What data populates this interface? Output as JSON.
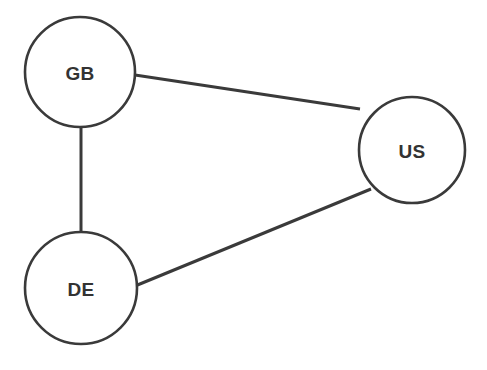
{
  "diagram": {
    "type": "node-link-graph",
    "title": "",
    "background_color": "#ffffff",
    "node_fill": "#ffffff",
    "node_stroke": "#3a3a3a",
    "edge_color": "#3a3a3a",
    "label_color": "#333333",
    "nodes": [
      {
        "id": "GB",
        "label": "GB",
        "cx": 80,
        "cy": 72,
        "r": 55
      },
      {
        "id": "US",
        "label": "US",
        "cx": 412,
        "cy": 150,
        "r": 53
      },
      {
        "id": "DE",
        "label": "DE",
        "cx": 81,
        "cy": 288,
        "r": 56
      }
    ],
    "edges": [
      {
        "id": "gb-us",
        "source": "GB",
        "target": "US",
        "x1": 135,
        "y1": 75,
        "x2": 360,
        "y2": 109
      },
      {
        "id": "gb-de",
        "source": "GB",
        "target": "DE",
        "x1": 81,
        "y1": 127,
        "x2": 81,
        "y2": 232
      },
      {
        "id": "de-us",
        "source": "DE",
        "target": "US",
        "x1": 135,
        "y1": 286,
        "x2": 371,
        "y2": 189
      }
    ]
  }
}
